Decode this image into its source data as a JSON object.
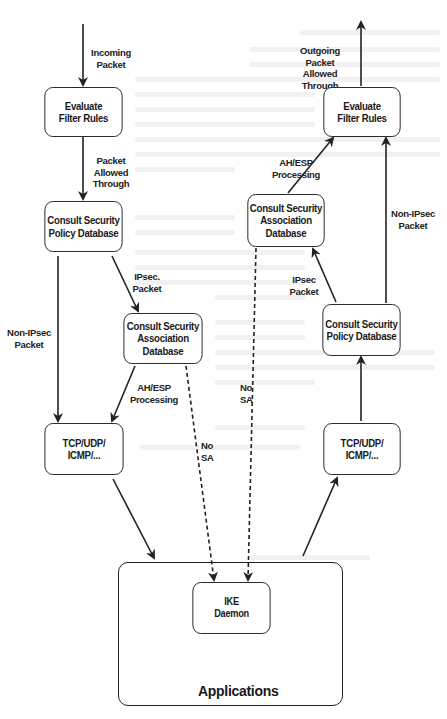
{
  "diagram": {
    "type": "flowchart",
    "inbound": {
      "edge_labels": {
        "incoming": "Incoming\nPacket",
        "allowed": "Packet\nAllowed\nThrough",
        "ipsec": "IPsec.\nPacket",
        "non_ipsec": "Non-IPsec\nPacket",
        "ahesp": "AH/ESP\nProcessing",
        "no_sa": "No\nSA"
      },
      "nodes": {
        "filter": "Evaluate\nFilter Rules",
        "spd": "Consult Security\nPolicy Database",
        "sad": "Consult Security\nAssociation\nDatabase",
        "transport": "TCP/UDP/\nICMP/..."
      }
    },
    "outbound": {
      "edge_labels": {
        "outgoing": "Outgoing Packet\nAllowed Through",
        "ahesp": "AH/ESP\nProcessing",
        "non_ipsec": "Non-IPsec\nPacket",
        "ipsec": "IPsec\nPacket",
        "no_sa": "No\nSA"
      },
      "nodes": {
        "filter": "Evaluate\nFilter Rules",
        "sad": "Consult Security\nAssociation\nDatabase",
        "spd": "Consult Security\nPolicy Database",
        "transport": "TCP/UDP/\nICMP/..."
      }
    },
    "shared": {
      "applications": "Applications",
      "ike": "IKE\nDaemon"
    },
    "colors": {
      "stroke": "#222222",
      "background": "#ffffff"
    }
  }
}
